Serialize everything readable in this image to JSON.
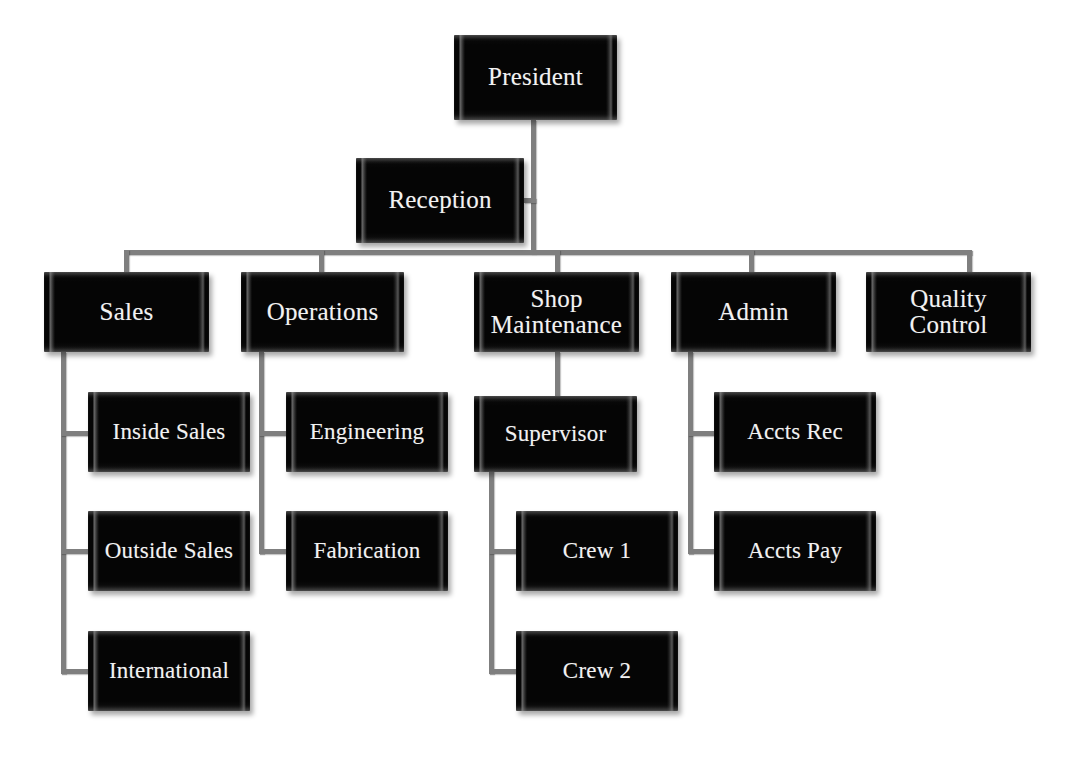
{
  "chart_title": "Organizational Chart",
  "style": {
    "box_fill": "#050505",
    "box_text": "#f2f2f2",
    "connector": "#7f7f7f",
    "background": "#ffffff"
  },
  "nodes": {
    "president": {
      "label": "President",
      "level": 1
    },
    "reception": {
      "label": "Reception",
      "level": 2
    },
    "sales": {
      "label": "Sales",
      "level": 3
    },
    "operations": {
      "label": "Operations",
      "level": 3
    },
    "shop_maintenance": {
      "label": "Shop\nMaintenance",
      "level": 3
    },
    "admin": {
      "label": "Admin",
      "level": 3
    },
    "quality_control": {
      "label": "Quality\nControl",
      "level": 3
    },
    "inside_sales": {
      "label": "Inside Sales",
      "level": 4
    },
    "outside_sales": {
      "label": "Outside Sales",
      "level": 4
    },
    "international": {
      "label": "International",
      "level": 4
    },
    "engineering": {
      "label": "Engineering",
      "level": 4
    },
    "fabrication": {
      "label": "Fabrication",
      "level": 4
    },
    "supervisor": {
      "label": "Supervisor",
      "level": 4
    },
    "accts_rec": {
      "label": "Accts Rec",
      "level": 4
    },
    "accts_pay": {
      "label": "Accts Pay",
      "level": 4
    },
    "crew_1": {
      "label": "Crew 1",
      "level": 5
    },
    "crew_2": {
      "label": "Crew 2",
      "level": 5
    }
  },
  "hierarchy": {
    "root": "president",
    "edges": [
      {
        "from": "president",
        "to": "reception",
        "type": "assistant"
      },
      {
        "from": "president",
        "to": "sales",
        "type": "subordinate"
      },
      {
        "from": "president",
        "to": "operations",
        "type": "subordinate"
      },
      {
        "from": "president",
        "to": "shop_maintenance",
        "type": "subordinate"
      },
      {
        "from": "president",
        "to": "admin",
        "type": "subordinate"
      },
      {
        "from": "president",
        "to": "quality_control",
        "type": "subordinate"
      },
      {
        "from": "sales",
        "to": "inside_sales",
        "type": "staff"
      },
      {
        "from": "sales",
        "to": "outside_sales",
        "type": "staff"
      },
      {
        "from": "sales",
        "to": "international",
        "type": "staff"
      },
      {
        "from": "operations",
        "to": "engineering",
        "type": "staff"
      },
      {
        "from": "operations",
        "to": "fabrication",
        "type": "staff"
      },
      {
        "from": "shop_maintenance",
        "to": "supervisor",
        "type": "subordinate"
      },
      {
        "from": "supervisor",
        "to": "crew_1",
        "type": "staff"
      },
      {
        "from": "supervisor",
        "to": "crew_2",
        "type": "staff"
      },
      {
        "from": "admin",
        "to": "accts_rec",
        "type": "staff"
      },
      {
        "from": "admin",
        "to": "accts_pay",
        "type": "staff"
      }
    ]
  }
}
